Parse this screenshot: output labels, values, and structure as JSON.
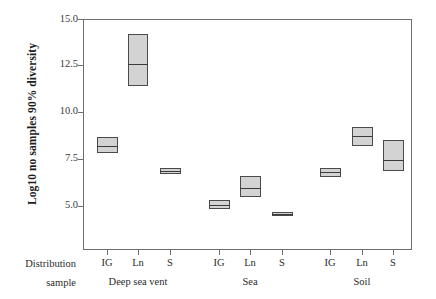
{
  "chart_data": {
    "type": "box",
    "title": "",
    "xlabel": "Distribution sample",
    "ylabel": "Log10 no samples 90% diversity",
    "ylim": [
      2.5,
      15.0
    ],
    "yticks": [
      15.0,
      12.5,
      10.0,
      7.5,
      5.0
    ],
    "ytick_labels": [
      "15.0",
      "12.5",
      "10.0",
      "7.5",
      "5.0"
    ],
    "grid": false,
    "legend": null,
    "groups": [
      "Deep sea vent",
      "Sea",
      "Soil"
    ],
    "categories": [
      "IG",
      "Ln",
      "S"
    ],
    "boxes": [
      {
        "group": "Deep sea vent",
        "category": "IG",
        "lower": 7.8,
        "median": 8.2,
        "upper": 8.7
      },
      {
        "group": "Deep sea vent",
        "category": "Ln",
        "lower": 11.4,
        "median": 12.6,
        "upper": 14.2
      },
      {
        "group": "Deep sea vent",
        "category": "S",
        "lower": 6.7,
        "median": 6.85,
        "upper": 7.0
      },
      {
        "group": "Sea",
        "category": "IG",
        "lower": 4.85,
        "median": 5.05,
        "upper": 5.3
      },
      {
        "group": "Sea",
        "category": "Ln",
        "lower": 5.45,
        "median": 5.95,
        "upper": 6.6
      },
      {
        "group": "Sea",
        "category": "S",
        "lower": 4.45,
        "median": 4.55,
        "upper": 4.65
      },
      {
        "group": "Soil",
        "category": "IG",
        "lower": 6.55,
        "median": 6.8,
        "upper": 7.0
      },
      {
        "group": "Soil",
        "category": "Ln",
        "lower": 8.2,
        "median": 8.75,
        "upper": 9.2
      },
      {
        "group": "Soil",
        "category": "S",
        "lower": 6.85,
        "median": 7.45,
        "upper": 8.5
      }
    ],
    "colors": {
      "box_fill": "#d3d3d3",
      "box_stroke": "#4a4a4a",
      "median_stroke": "#3a3a3a",
      "axis": "#6e6e6e",
      "text": "#2b2b2b",
      "background": "#ffffff"
    }
  },
  "axis_caption": {
    "line1": "Distribution",
    "line2": "sample"
  },
  "category_labels": [
    "IG",
    "Ln",
    "S",
    "IG",
    "Ln",
    "S",
    "IG",
    "Ln",
    "S"
  ],
  "group_labels": [
    "Deep sea vent",
    "Sea",
    "Soil"
  ]
}
